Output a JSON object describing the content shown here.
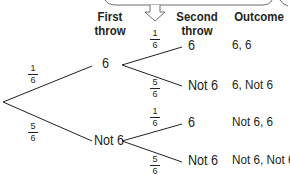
{
  "headers": {
    "first_throw": [
      "First",
      "throw"
    ],
    "second_throw": [
      "Second",
      "throw"
    ],
    "outcome": "Outcome"
  },
  "first_throw": {
    "branches": [
      {
        "label": "6",
        "probability": {
          "num": "1",
          "den": "6"
        }
      },
      {
        "label": "Not 6",
        "probability": {
          "num": "5",
          "den": "6"
        }
      }
    ]
  },
  "second_throw": {
    "after_6": [
      {
        "label": "6",
        "probability": {
          "num": "1",
          "den": "6"
        },
        "outcome": "6, 6"
      },
      {
        "label": "Not 6",
        "probability": {
          "num": "5",
          "den": "6"
        },
        "outcome": "6, Not 6"
      }
    ],
    "after_not_6": [
      {
        "label": "6",
        "probability": {
          "num": "1",
          "den": "6"
        },
        "outcome": "Not 6, 6"
      },
      {
        "label": "Not 6",
        "probability": {
          "num": "5",
          "den": "6"
        },
        "outcome": "Not 6, Not 6"
      }
    ]
  },
  "colors": {
    "line": "#231f20",
    "callout": "#6d6e71"
  }
}
